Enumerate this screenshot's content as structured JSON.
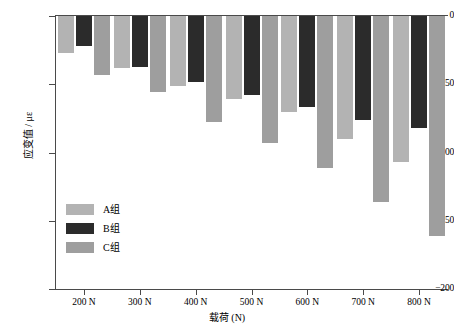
{
  "chart_data": {
    "type": "bar",
    "title": "",
    "xlabel": "载荷 (N)",
    "ylabel": "应变值 / με",
    "categories": [
      "200 N",
      "300 N",
      "400 N",
      "500 N",
      "600 N",
      "700 N",
      "800 N"
    ],
    "series": [
      {
        "name": "A组",
        "color": "#b3b3b3",
        "values": [
          -27,
          -38,
          -51,
          -61,
          -70,
          -90,
          -107
        ]
      },
      {
        "name": "B组",
        "color": "#2b2b2b",
        "values": [
          -22,
          -37,
          -48,
          -58,
          -67,
          -76,
          -82
        ]
      },
      {
        "name": "C组",
        "color": "#9e9e9e",
        "values": [
          -43,
          -56,
          -78,
          -93,
          -111,
          -136,
          -161
        ]
      }
    ],
    "ylim": [
      -200,
      0
    ],
    "yticks": [
      0,
      -50,
      -100,
      -150,
      -200
    ],
    "ytick_labels": [
      "0",
      "−50",
      "−100",
      "−150",
      "−200"
    ],
    "grid": false,
    "legend_position": "inside-lower-left",
    "annotations": [
      {
        "series": "B组",
        "category": "200 N",
        "symbol": "▽",
        "name": "triangle-marker"
      },
      {
        "series": "B组",
        "category": "300 N",
        "symbol": "▽",
        "name": "triangle-marker"
      },
      {
        "series": "B组",
        "category": "400 N",
        "symbol": "▽",
        "name": "triangle-marker"
      },
      {
        "series": "B组",
        "category": "500 N",
        "symbol": "▽",
        "name": "triangle-marker"
      },
      {
        "series": "B组",
        "category": "600 N",
        "symbol": "▽",
        "name": "triangle-marker"
      },
      {
        "series": "B组",
        "category": "700 N",
        "symbol": "▽",
        "name": "triangle-marker"
      },
      {
        "series": "B组",
        "category": "800 N",
        "symbol": "▽",
        "name": "triangle-marker"
      },
      {
        "series": "C组",
        "category": "200 N",
        "symbol": "☆",
        "name": "star-marker"
      },
      {
        "series": "C组",
        "category": "300 N",
        "symbol": "☆",
        "name": "star-marker"
      },
      {
        "series": "C组",
        "category": "400 N",
        "symbol": "☆",
        "name": "star-marker"
      },
      {
        "series": "C组",
        "category": "500 N",
        "symbol": "✱",
        "name": "asterisk-marker"
      },
      {
        "series": "C组",
        "category": "600 N",
        "symbol": "✱",
        "name": "asterisk-marker"
      },
      {
        "series": "C组",
        "category": "700 N",
        "symbol": "✱",
        "name": "asterisk-marker"
      },
      {
        "series": "C组",
        "category": "800 N",
        "symbol": "✱",
        "name": "asterisk-marker"
      }
    ]
  }
}
